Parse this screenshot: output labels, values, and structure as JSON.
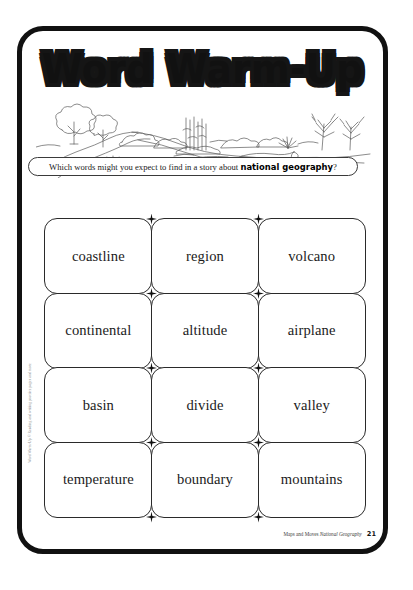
{
  "page": {
    "title": "Word Warm-Up",
    "illustration_name": "landscape-line-drawing"
  },
  "instruction": {
    "prefix": "Which words might you expect to find in a story about ",
    "topic": "national geography",
    "suffix": "?"
  },
  "word_grid": {
    "columns": 3,
    "rows": 4,
    "cards": [
      {
        "label": "coastline"
      },
      {
        "label": "region"
      },
      {
        "label": "volcano"
      },
      {
        "label": "continental"
      },
      {
        "label": "altitude"
      },
      {
        "label": "airplane"
      },
      {
        "label": "basin"
      },
      {
        "label": "divide"
      },
      {
        "label": "valley"
      },
      {
        "label": "temperature"
      },
      {
        "label": "boundary"
      },
      {
        "label": "mountains"
      }
    ]
  },
  "footer": {
    "source_prefix": "Maps and Moves",
    "source_title": "National Geography",
    "page_number": "21"
  },
  "sidebar": {
    "copyright": "Word Warm-Up © Reading and writing practice pages and more"
  },
  "colors": {
    "ink": "#111111",
    "card_border": "#2a2a2a",
    "paper": "#ffffff"
  }
}
